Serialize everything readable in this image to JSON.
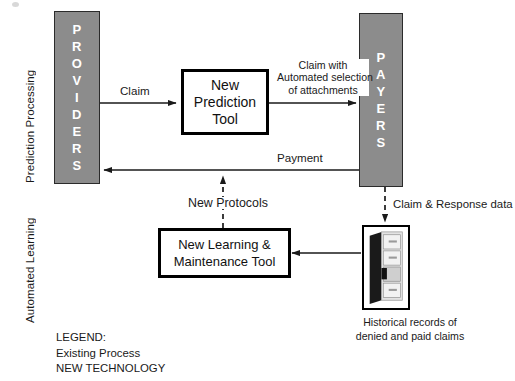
{
  "diagram": {
    "swimlanes": [
      {
        "id": "prediction-processing",
        "label": "Prediction Processing"
      },
      {
        "id": "automated-learning",
        "label": "Automated Learning"
      }
    ],
    "actors": [
      {
        "id": "providers",
        "label": "PROVIDERS",
        "letters": [
          "P",
          "R",
          "O",
          "V",
          "I",
          "D",
          "E",
          "R",
          "S"
        ],
        "fill": "#8c8c8c",
        "text_color": "#ffffff"
      },
      {
        "id": "payers",
        "label": "PAYERS",
        "letters": [
          "P",
          "A",
          "Y",
          "E",
          "R",
          "S"
        ],
        "fill": "#8c8c8c",
        "text_color": "#ffffff"
      }
    ],
    "nodes": [
      {
        "id": "prediction-tool",
        "label": "New\nPrediction\nTool",
        "lines": [
          "New",
          "Prediction",
          "Tool"
        ],
        "type": "new-technology"
      },
      {
        "id": "learning-tool",
        "label": "New Learning &\nMaintenance Tool",
        "lines": [
          "New Learning &",
          "Maintenance Tool"
        ],
        "type": "new-technology"
      },
      {
        "id": "historical-records",
        "label": "Historical records of denied and paid claims",
        "caption_lines": [
          "Historical records of",
          "denied and paid claims"
        ],
        "type": "data-store"
      }
    ],
    "edges": [
      {
        "id": "claim",
        "label": "Claim",
        "from": "providers",
        "to": "prediction-tool",
        "style": "solid"
      },
      {
        "id": "claim-with-attachments",
        "label": "Claim with Automated selection of attachments",
        "lines": [
          "Claim with",
          "Automated selection",
          "of attachments"
        ],
        "from": "prediction-tool",
        "to": "payers",
        "style": "solid"
      },
      {
        "id": "payment",
        "label": "Payment",
        "from": "payers",
        "to": "providers",
        "style": "solid"
      },
      {
        "id": "new-protocols",
        "label": "New Protocols",
        "from": "learning-tool",
        "to": "payment",
        "style": "dashed"
      },
      {
        "id": "claim-response-data",
        "label": "Claim & Response data",
        "from": "payers",
        "to": "historical-records",
        "style": "dashed"
      },
      {
        "id": "records-to-learning",
        "label": "",
        "from": "historical-records",
        "to": "learning-tool",
        "style": "solid"
      }
    ],
    "legend": {
      "title": "LEGEND:",
      "entries": [
        {
          "id": "existing-process",
          "label": "Existing Process"
        },
        {
          "id": "new-technology",
          "label": "NEW TECHNOLOGY"
        }
      ]
    },
    "colors": {
      "actor_fill": "#8c8c8c",
      "actor_border": "#2b2b2b",
      "line": "#1a1a1a",
      "box_border": "#000000",
      "background": "#ffffff"
    }
  }
}
